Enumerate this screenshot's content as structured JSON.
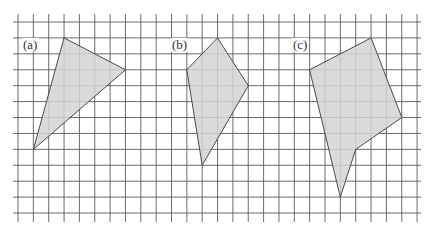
{
  "figure": {
    "grid": {
      "x0": 18,
      "y0": 22,
      "dx": 15.35,
      "dy": 15.92,
      "cols": 26,
      "rows": 12,
      "h_line_x_start": 13,
      "h_line_x_end": 421,
      "v_line_y_start": 14,
      "v_line_y_end": 222,
      "line_color": "#5a5a5a"
    },
    "fill_color": "#d4d4d4",
    "stroke_color": "#4a4a4a",
    "shapes": [
      {
        "id": "a",
        "label": "(a)",
        "label_pos": [
          23,
          49
        ],
        "vertices_grid": [
          [
            3,
            1
          ],
          [
            7,
            3
          ],
          [
            1,
            8
          ]
        ]
      },
      {
        "id": "b",
        "label": "(b)",
        "label_pos": [
          172,
          49
        ],
        "vertices_grid": [
          [
            13,
            1
          ],
          [
            15,
            4
          ],
          [
            12,
            9
          ],
          [
            11,
            3
          ]
        ]
      },
      {
        "id": "c",
        "label": "(c)",
        "label_pos": [
          293,
          49
        ],
        "vertices_grid": [
          [
            23,
            1
          ],
          [
            25,
            6
          ],
          [
            22,
            8
          ],
          [
            21,
            11
          ],
          [
            19,
            3
          ]
        ]
      }
    ]
  }
}
